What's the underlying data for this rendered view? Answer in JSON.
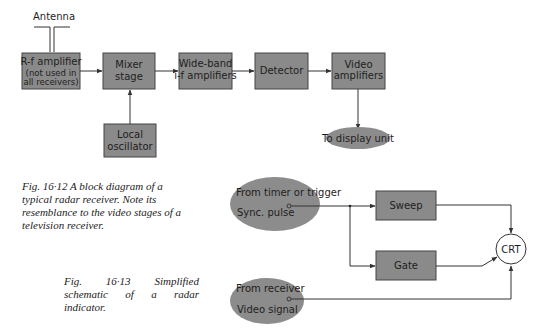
{
  "colors": {
    "block_fill": "#8a8a8a",
    "ellipse_fill": "#8c8c8c",
    "line": "#333333",
    "text": "#1e1e1e"
  },
  "fig_12": {
    "antenna_label": "Antenna",
    "blocks": {
      "rf_amp": [
        "R-f amplifier",
        "(not used in",
        "all receivers)"
      ],
      "mixer": [
        "Mixer",
        "stage"
      ],
      "wideband": [
        "Wide-band",
        "i-f amplifiers"
      ],
      "detector": [
        "Detector"
      ],
      "video_amp": [
        "Video",
        "amplifiers"
      ],
      "local_osc": [
        "Local",
        "oscillator"
      ]
    },
    "output_label": "To display unit",
    "caption": "Fig. 16·12   A block diagram of a typical radar receiver. Note its resemblance to the video stages of a television receiver."
  },
  "fig_13": {
    "trigger_source": [
      "From timer or trigger",
      "Sync. pulse"
    ],
    "video_source": [
      "From receiver",
      "Video signal"
    ],
    "blocks": {
      "sweep": "Sweep",
      "gate": "Gate"
    },
    "crt_label": "CRT",
    "caption": "Fig. 16·13   Simplified schematic of a radar indicator."
  }
}
